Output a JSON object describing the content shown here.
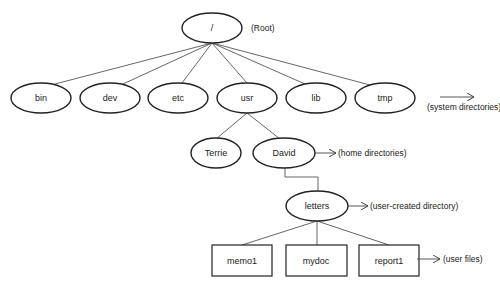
{
  "diagram": {
    "root": {
      "label": "/",
      "note": "(Root)"
    },
    "system_dirs": {
      "items": [
        "bin",
        "dev",
        "etc",
        "usr",
        "lib",
        "tmp"
      ],
      "note": "(system directories)"
    },
    "home_dirs": {
      "items": [
        "Terrie",
        "David"
      ],
      "note": "(home directories)"
    },
    "user_dir": {
      "label": "letters",
      "note": "(user-created directory)"
    },
    "user_files": {
      "items": [
        "memo1",
        "mydoc",
        "report1"
      ],
      "note": "(user files)"
    },
    "colors": {
      "stroke": "#222222",
      "line": "#555555",
      "background": "#ffffff"
    }
  }
}
